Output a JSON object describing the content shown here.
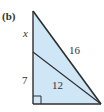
{
  "figure": {
    "panel_label": "(b)",
    "labels": {
      "upper_segment": "x",
      "lower_segment": "7",
      "hypotenuse": "16",
      "inner_segment": "12"
    },
    "colors": {
      "fill": "#cfe6f6",
      "stroke": "#2e2e2e",
      "text": "#333333"
    },
    "right_angle": true
  }
}
